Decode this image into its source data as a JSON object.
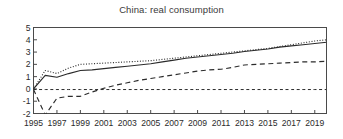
{
  "chart_data": {
    "type": "line",
    "title": "China: real consumption",
    "xlabel": "",
    "ylabel": "",
    "xlim": [
      1995,
      2020
    ],
    "ylim": [
      -2,
      5
    ],
    "grid": false,
    "legend": "none",
    "ytick_labels": [
      "5",
      "4",
      "3",
      "2",
      "1",
      "0",
      "-1",
      "-2"
    ],
    "ytick_values": [
      5,
      4,
      3,
      2,
      1,
      0,
      -1,
      -2
    ],
    "xtick_labels": [
      "1995",
      "1997",
      "1999",
      "2001",
      "2003",
      "2005",
      "2007",
      "2009",
      "2011",
      "2013",
      "2015",
      "2017",
      "2019"
    ],
    "xtick_values": [
      1995,
      1997,
      1999,
      2001,
      2003,
      2005,
      2007,
      2009,
      2011,
      2013,
      2015,
      2017,
      2019
    ],
    "x": [
      1995,
      1996,
      1997,
      1998,
      1999,
      2000,
      2001,
      2002,
      2003,
      2004,
      2005,
      2006,
      2007,
      2008,
      2009,
      2010,
      2011,
      2012,
      2013,
      2014,
      2015,
      2016,
      2017,
      2018,
      2019,
      2020
    ],
    "series": [
      {
        "name": "solid-line",
        "style": "solid",
        "color": "#2b2b2b",
        "values": [
          0.0,
          1.1,
          0.95,
          1.25,
          1.5,
          1.55,
          1.65,
          1.75,
          1.85,
          1.95,
          2.05,
          2.2,
          2.35,
          2.5,
          2.6,
          2.7,
          2.8,
          2.9,
          3.05,
          3.15,
          3.25,
          3.4,
          3.5,
          3.6,
          3.7,
          3.8
        ]
      },
      {
        "name": "dotted-line",
        "style": "dotted",
        "color": "#2b2b2b",
        "values": [
          0.0,
          1.5,
          1.25,
          1.7,
          2.0,
          2.05,
          2.1,
          2.15,
          2.2,
          2.25,
          2.3,
          2.4,
          2.5,
          2.6,
          2.7,
          2.8,
          2.9,
          3.0,
          3.1,
          3.2,
          3.3,
          3.45,
          3.6,
          3.75,
          3.9,
          4.0
        ]
      },
      {
        "name": "dashed-line",
        "style": "dashed",
        "color": "#2b2b2b",
        "values": [
          -0.05,
          -2.3,
          -0.75,
          -0.6,
          -0.6,
          -0.25,
          0.05,
          0.3,
          0.5,
          0.7,
          0.85,
          1.0,
          1.15,
          1.3,
          1.45,
          1.55,
          1.6,
          1.75,
          1.95,
          2.0,
          2.05,
          2.1,
          2.15,
          2.2,
          2.2,
          2.25
        ]
      },
      {
        "name": "zero-reference-line",
        "style": "dashdot",
        "color": "#2b2b2b",
        "values": [
          -0.05,
          -0.05,
          -0.05,
          -0.05,
          -0.05,
          -0.05,
          -0.05,
          -0.05,
          -0.05,
          -0.05,
          -0.05,
          -0.05,
          -0.05,
          -0.05,
          -0.05,
          -0.05,
          -0.05,
          -0.05,
          -0.05,
          -0.05,
          -0.05,
          -0.05,
          -0.05,
          -0.05,
          -0.05,
          -0.05
        ]
      }
    ]
  }
}
